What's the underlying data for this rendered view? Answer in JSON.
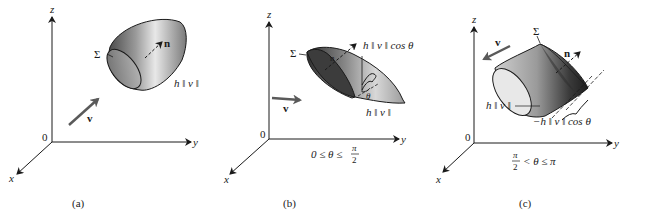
{
  "figure": {
    "panels": [
      {
        "id": "a",
        "caption": "(a)",
        "axes": {
          "x": "x",
          "y": "y",
          "z": "z",
          "origin": "0"
        },
        "surface_label": "Σ",
        "normal_label": "n",
        "velocity_label": "v",
        "height_label": "h ‖ v ‖",
        "condition": ""
      },
      {
        "id": "b",
        "caption": "(b)",
        "axes": {
          "x": "x",
          "y": "y",
          "z": "z",
          "origin": "0"
        },
        "surface_label": "Σ",
        "normal_label": "n",
        "velocity_label": "v",
        "height_label": "h ‖ v ‖",
        "projected_height_label": "h ‖ v ‖ cos θ",
        "angle_label": "θ",
        "condition": "0 ≤ θ ≤ π/2",
        "condition_parts": {
          "left": "0 ≤ θ ≤",
          "num": "π",
          "den": "2"
        }
      },
      {
        "id": "c",
        "caption": "(c)",
        "axes": {
          "x": "x",
          "y": "y",
          "z": "z",
          "origin": "0"
        },
        "surface_label": "Σ",
        "normal_label": "n",
        "velocity_label": "v",
        "height_label": "h ‖ v ‖",
        "projected_height_label": "−h ‖ v ‖ cos θ",
        "condition": "π/2 < θ ≤ π",
        "condition_parts": {
          "num": "π",
          "den": "2",
          "right": "< θ ≤ π"
        }
      }
    ],
    "colors": {
      "ink": "#1a1a1a",
      "shade_dark": "#3a3a3a",
      "shade_mid": "#8a8a8a",
      "shade_light": "#e6e6e6",
      "velocity_arrow": "#5a5a5a"
    }
  }
}
